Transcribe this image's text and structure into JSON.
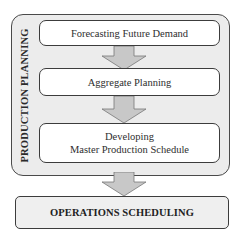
{
  "diagram": {
    "type": "flowchart",
    "colors": {
      "panel_fill": "#ececec",
      "box_fill": "#ffffff",
      "border": "#3c3c3c",
      "arrow_fill": "#c8c8c8",
      "arrow_stroke": "#777777",
      "ops_fill": "#efefef"
    },
    "group": {
      "label": "PRODUCTION PLANNING",
      "steps": [
        {
          "id": "step1",
          "label": "Forecasting Future Demand"
        },
        {
          "id": "step2",
          "label": "Aggregate Planning"
        },
        {
          "id": "step3",
          "lines": [
            "Developing",
            "Master Production Schedule"
          ]
        }
      ]
    },
    "output": {
      "label": "OPERATIONS SCHEDULING"
    },
    "edges": [
      {
        "from": "step1",
        "to": "step2",
        "icon": "down-arrow-icon"
      },
      {
        "from": "step2",
        "to": "step3",
        "icon": "down-arrow-icon"
      },
      {
        "from": "group",
        "to": "output",
        "icon": "down-arrow-icon"
      }
    ]
  }
}
